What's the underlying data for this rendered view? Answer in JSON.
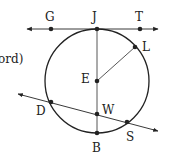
{
  "diagram": {
    "partial_text": "ord)",
    "circle": {
      "center_label": "E",
      "cx": 97,
      "cy": 81,
      "r": 52
    },
    "points": [
      {
        "label": "G",
        "x": 51,
        "y": 29,
        "lx": 45,
        "ly": 21
      },
      {
        "label": "J",
        "x": 97,
        "y": 29,
        "lx": 92,
        "ly": 21
      },
      {
        "label": "T",
        "x": 140,
        "y": 29,
        "lx": 135,
        "ly": 21
      },
      {
        "label": "L",
        "x": 135,
        "y": 47,
        "lx": 142,
        "ly": 51
      },
      {
        "label": "E",
        "x": 97,
        "y": 81,
        "lx": 81,
        "ly": 83
      },
      {
        "label": "W",
        "x": 97,
        "y": 114,
        "lx": 102,
        "ly": 114
      },
      {
        "label": "D",
        "x": 51,
        "y": 102,
        "lx": 36,
        "ly": 115
      },
      {
        "label": "S",
        "x": 127,
        "y": 122,
        "lx": 126,
        "ly": 141
      },
      {
        "label": "B",
        "x": 97,
        "y": 133,
        "lx": 92,
        "ly": 152
      }
    ],
    "lines": [
      {
        "name": "tangent-GT",
        "x1": 27,
        "y1": 29,
        "x2": 158,
        "y2": 29,
        "arrows": true
      },
      {
        "name": "secant-DS",
        "x1": 18,
        "y1": 94,
        "x2": 158,
        "y2": 131,
        "arrows": true
      }
    ],
    "segments": [
      {
        "name": "diameter-JB",
        "x1": 97,
        "y1": 29,
        "x2": 97,
        "y2": 133
      },
      {
        "name": "radius-EL",
        "x1": 97,
        "y1": 81,
        "x2": 135,
        "y2": 47
      }
    ],
    "colors": {
      "stroke": "#222222",
      "background": "#ffffff"
    }
  }
}
